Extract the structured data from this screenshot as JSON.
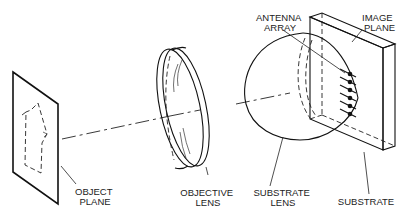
{
  "diagram": {
    "type": "optical-system-schematic",
    "components": [
      {
        "id": "object-plane",
        "label_lines": [
          "OBJECT",
          "PLANE"
        ]
      },
      {
        "id": "objective-lens",
        "label_lines": [
          "OBJECTIVE",
          "LENS"
        ]
      },
      {
        "id": "substrate-lens",
        "label_lines": [
          "SUBSTRATE",
          "LENS"
        ]
      },
      {
        "id": "substrate",
        "label_lines": [
          "SUBSTRATE"
        ]
      },
      {
        "id": "antenna-array",
        "label_lines": [
          "ANTENNA",
          "ARRAY"
        ]
      },
      {
        "id": "image-plane",
        "label_lines": [
          "IMAGE",
          "PLANE"
        ]
      }
    ],
    "antenna_element_count": 6,
    "colors": {
      "line": "#111111",
      "background": "#ffffff",
      "text": "#222222"
    }
  },
  "labels": {
    "object_plane": [
      "OBJECT",
      "PLANE"
    ],
    "objective_lens": [
      "OBJECTIVE",
      "LENS"
    ],
    "substrate_lens": [
      "SUBSTRATE",
      "LENS"
    ],
    "substrate": "SUBSTRATE",
    "antenna_array": [
      "ANTENNA",
      "ARRAY"
    ],
    "image_plane": [
      "IMAGE",
      "PLANE"
    ]
  }
}
